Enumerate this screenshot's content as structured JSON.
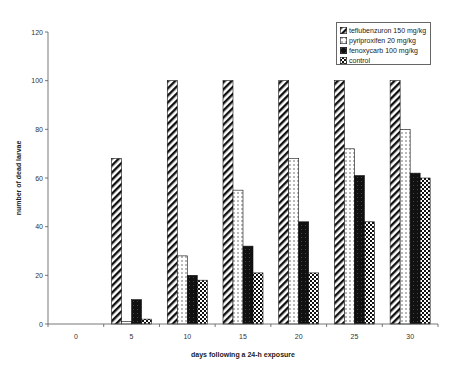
{
  "chart_data": {
    "type": "bar",
    "title": "",
    "xlabel": "days following a 24-h exposure",
    "ylabel": "number of dead larvae",
    "categories": [
      "0",
      "5",
      "10",
      "15",
      "20",
      "25",
      "30"
    ],
    "ylim": [
      0,
      120
    ],
    "yticks": [
      0,
      20,
      40,
      60,
      80,
      100,
      120
    ],
    "grid": false,
    "legend_position": "top-right",
    "series": [
      {
        "name": "teflubenzuron 150 mg/kg",
        "pattern": "diagonal-hatch",
        "values": [
          0,
          68,
          100,
          100,
          100,
          100,
          100
        ]
      },
      {
        "name": "pyriproxifen 20 mg/kg",
        "pattern": "dotted-white",
        "values": [
          0,
          1,
          28,
          55,
          68,
          72,
          80
        ]
      },
      {
        "name": "fenoxycarb 100 mg/kg",
        "pattern": "solid-black",
        "values": [
          0,
          10,
          20,
          32,
          42,
          61,
          62
        ]
      },
      {
        "name": "control",
        "pattern": "checker",
        "values": [
          0,
          2,
          18,
          21,
          21,
          42,
          60
        ]
      }
    ]
  }
}
